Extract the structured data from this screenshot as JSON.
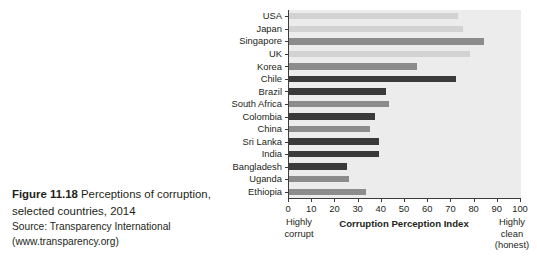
{
  "caption": {
    "figure_number": "Figure 11.18",
    "title_part1": " Perceptions of corruption,",
    "title_part2": "selected countries, 2014",
    "source": "Source: Transparency International",
    "source_url": "(www.transparency.org)"
  },
  "annotations": {
    "left_label_line1": "Highly",
    "left_label_line2": "corrupt",
    "right_label_line1": "Highly",
    "right_label_line2": "clean",
    "right_label_line3": "(honest)"
  },
  "colors": {
    "plot_background": "#ececec",
    "axis": "#3b3b3b",
    "text": "#231f20",
    "bar_light": "#d2d2d2",
    "bar_medium": "#8c8c8c",
    "bar_dark": "#3a3a3a"
  },
  "chart_data": {
    "type": "bar",
    "orientation": "horizontal",
    "title": "Perceptions of corruption, selected countries, 2014",
    "xlabel": "Corruption Perception Index",
    "ylabel": "",
    "xlim": [
      0,
      100
    ],
    "xticks": [
      0,
      10,
      20,
      30,
      40,
      50,
      60,
      70,
      80,
      90,
      100
    ],
    "xtick_labels": [
      "0",
      "10",
      "20",
      "30",
      "40",
      "50",
      "60",
      "70",
      "80",
      "90",
      "100"
    ],
    "grid": false,
    "legend": "none",
    "categories": [
      "USA",
      "Japan",
      "Singapore",
      "UK",
      "Korea",
      "Chile",
      "Brazil",
      "South Africa",
      "Colombia",
      "China",
      "Sri Lanka",
      "India",
      "Bangladesh",
      "Uganda",
      "Ethiopia"
    ],
    "values": [
      73,
      75,
      84,
      78,
      55,
      72,
      42,
      43,
      37,
      35,
      39,
      39,
      25,
      26,
      33
    ],
    "bars": [
      {
        "label": "USA",
        "value": 73,
        "shade": "light"
      },
      {
        "label": "Japan",
        "value": 75,
        "shade": "light"
      },
      {
        "label": "Singapore",
        "value": 84,
        "shade": "medium"
      },
      {
        "label": "UK",
        "value": 78,
        "shade": "light"
      },
      {
        "label": "Korea",
        "value": 55,
        "shade": "medium"
      },
      {
        "label": "Chile",
        "value": 72,
        "shade": "dark"
      },
      {
        "label": "Brazil",
        "value": 42,
        "shade": "dark"
      },
      {
        "label": "South Africa",
        "value": 43,
        "shade": "medium"
      },
      {
        "label": "Colombia",
        "value": 37,
        "shade": "dark"
      },
      {
        "label": "China",
        "value": 35,
        "shade": "medium"
      },
      {
        "label": "Sri Lanka",
        "value": 39,
        "shade": "dark"
      },
      {
        "label": "India",
        "value": 39,
        "shade": "dark"
      },
      {
        "label": "Bangladesh",
        "value": 25,
        "shade": "dark"
      },
      {
        "label": "Uganda",
        "value": 26,
        "shade": "medium"
      },
      {
        "label": "Ethiopia",
        "value": 33,
        "shade": "medium"
      }
    ]
  }
}
